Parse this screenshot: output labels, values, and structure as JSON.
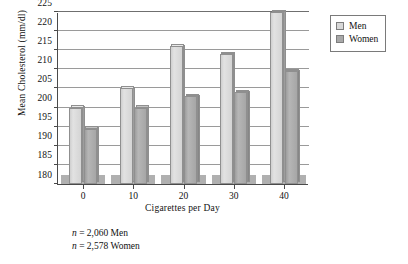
{
  "chart_data": {
    "type": "bar",
    "title": "",
    "xlabel": "Cigarettes per Day",
    "ylabel": "Mean Cholesterol (mm/dl)",
    "categories": [
      "0",
      "10",
      "20",
      "30",
      "40"
    ],
    "ylim": [
      180,
      225
    ],
    "yticks": [
      180,
      185,
      190,
      195,
      200,
      205,
      210,
      215,
      220,
      225
    ],
    "ytick_labels": [
      "180",
      "185",
      "190",
      "195",
      "200",
      "205",
      "210",
      "215",
      "220",
      "225"
    ],
    "grid": true,
    "legend_position": "right-top",
    "series": [
      {
        "name": "Men",
        "color": "#d8d8d8",
        "values": [
          200,
          205,
          216,
          214,
          225
        ]
      },
      {
        "name": "Women",
        "color": "#a8a8a8",
        "values": [
          194.5,
          200,
          203,
          204,
          209.5
        ]
      }
    ],
    "annotations": [
      "n = 2,060 Men",
      "n = 2,578 Women"
    ]
  },
  "legend": {
    "items": [
      {
        "label": "Men",
        "color": "#d8d8d8"
      },
      {
        "label": "Women",
        "color": "#a8a8a8"
      }
    ]
  },
  "footnote": {
    "line1_prefix": "n",
    "line1_rest": " = 2,060 Men",
    "line2_prefix": "n",
    "line2_rest": " = 2,578 Women"
  }
}
